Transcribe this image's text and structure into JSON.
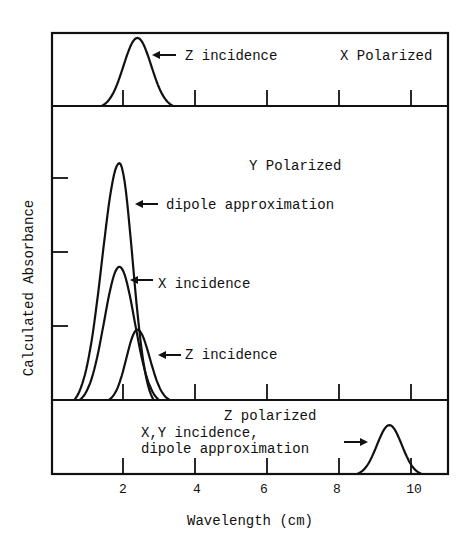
{
  "chart_data": {
    "type": "line",
    "xlabel": "Wavelength (cm)",
    "ylabel": "Calculated Absorbance",
    "xlim": [
      0,
      11
    ],
    "x_ticks": [
      2,
      4,
      6,
      8,
      10
    ],
    "y_ticks_middle_panel": [
      1,
      2,
      3
    ],
    "grid": false,
    "legend": "none (curves labeled with arrows)",
    "panels": [
      {
        "name": "X Polarized",
        "title": "X Polarized",
        "series": [
          {
            "name": "Z incidence",
            "label": "Z incidence",
            "start": 1.4,
            "peak_x": 2.4,
            "end": 3.4,
            "peak_y": 0.92,
            "x": [
              1.4,
              1.9,
              2.4,
              2.9,
              3.4
            ],
            "y": [
              0,
              0.55,
              0.92,
              0.55,
              0
            ]
          }
        ]
      },
      {
        "name": "Y Polarized",
        "title": "Y Polarized",
        "series": [
          {
            "name": "dipole approximation",
            "label": "dipole approximation",
            "start": 0.65,
            "peak_x": 1.9,
            "end": 2.85,
            "peak_y": 3.2,
            "x": [
              0.65,
              1.3,
              1.9,
              2.4,
              2.85
            ],
            "y": [
              0,
              1.6,
              3.2,
              1.6,
              0
            ]
          },
          {
            "name": "X incidence",
            "label": "X incidence",
            "start": 0.8,
            "peak_x": 1.9,
            "end": 3.0,
            "peak_y": 1.8,
            "x": [
              0.8,
              1.35,
              1.9,
              2.45,
              3.0
            ],
            "y": [
              0,
              0.95,
              1.8,
              0.95,
              0
            ]
          },
          {
            "name": "Z incidence",
            "label": "Z incidence",
            "start": 1.6,
            "peak_x": 2.4,
            "end": 3.3,
            "peak_y": 0.95,
            "x": [
              1.6,
              2.0,
              2.4,
              2.85,
              3.3
            ],
            "y": [
              0,
              0.55,
              0.95,
              0.55,
              0
            ]
          }
        ]
      },
      {
        "name": "Z polarized",
        "title": "Z polarized",
        "series": [
          {
            "name": "X,Y incidence, dipole approximation",
            "label": "X,Y incidence, dipole approximation",
            "start": 8.5,
            "peak_x": 9.4,
            "end": 10.3,
            "peak_y": 0.66,
            "x": [
              8.5,
              8.95,
              9.4,
              9.85,
              10.3
            ],
            "y": [
              0,
              0.38,
              0.66,
              0.38,
              0
            ]
          }
        ]
      }
    ]
  },
  "labels": {
    "top_panel_title": "X Polarized",
    "top_curve_label": "Z incidence",
    "middle_panel_title": "Y Polarized",
    "middle_dipole_label": "dipole approximation",
    "middle_x_label": "X incidence",
    "middle_z_label": "Z incidence",
    "bottom_panel_title": "Z polarized",
    "bottom_label_line1": "X,Y incidence,",
    "bottom_label_line2": "dipole approximation",
    "xlabel": "Wavelength (cm)",
    "ylabel": "Calculated Absorbance",
    "x_tick_2": "2",
    "x_tick_4": "4",
    "x_tick_6": "6",
    "x_tick_8": "8",
    "x_tick_10": "10"
  }
}
